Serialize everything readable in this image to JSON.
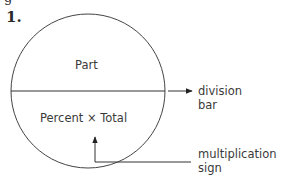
{
  "figure": {
    "number_label": "1.",
    "top_fragment": "g"
  },
  "circle": {
    "top_label": "Part",
    "bottom_label": {
      "left": "Percent",
      "operator": "×",
      "right": "Total"
    }
  },
  "callouts": {
    "division_bar": {
      "line1": "division",
      "line2": "bar"
    },
    "multiplication_sign": {
      "line1": "multiplication",
      "line2": "sign"
    }
  },
  "colors": {
    "line": "#3a3a3a",
    "text": "#3a3a3a",
    "background": "#ffffff"
  }
}
